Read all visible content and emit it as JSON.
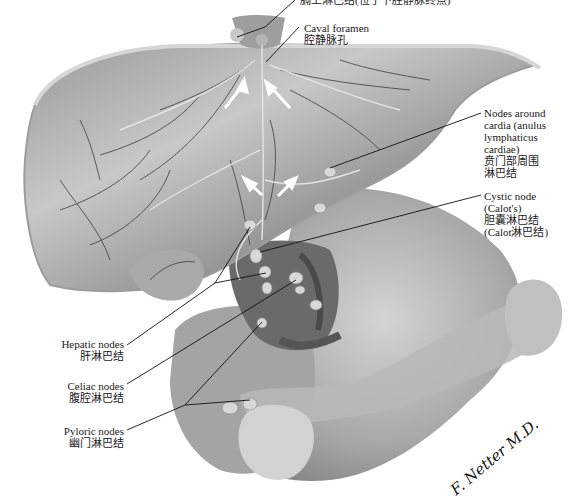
{
  "figure": {
    "style": "grayscale anatomical illustration",
    "signature": "F. Netter M.D."
  },
  "labels": [
    {
      "id": "superior-phrenic",
      "en": "",
      "zh": "膈上淋巴结(位于下腔静脉终点)",
      "side": "top"
    },
    {
      "id": "caval-foramen",
      "en": "Caval foramen",
      "zh": "腔静脉孔",
      "side": "top"
    },
    {
      "id": "nodes-around-cardia",
      "en": [
        "Nodes around",
        "cardia (anulus",
        "lymphaticus",
        "cardiae)"
      ],
      "zh": [
        "贲门部周围",
        "淋巴结"
      ],
      "side": "right"
    },
    {
      "id": "cystic-node",
      "en": [
        "Cystic node",
        "(Calot's)"
      ],
      "zh": [
        "胆囊淋巴结",
        "(Calot淋巴结)"
      ],
      "side": "right"
    },
    {
      "id": "hepatic-nodes",
      "en": "Hepatic nodes",
      "zh": "肝淋巴结",
      "side": "left"
    },
    {
      "id": "celiac-nodes",
      "en": "Celiac nodes",
      "zh": "腹腔淋巴结",
      "side": "left"
    },
    {
      "id": "pyloric-nodes",
      "en": "Pyloric nodes",
      "zh": "幽门淋巴结",
      "side": "left"
    }
  ],
  "colors": {
    "background": "#ffffff",
    "organ_light": "#bdbdbd",
    "organ_mid": "#8f8f8f",
    "organ_dark": "#5a5a5a",
    "vessel": "#3a3a3a",
    "lymph": "#e6e6e6",
    "leader": "#111111",
    "arrow": "#ffffff"
  }
}
